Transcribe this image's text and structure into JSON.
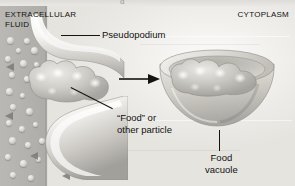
{
  "figure": {
    "top_crop_remnant": "d"
  },
  "regions": {
    "extracellular_fluid": {
      "line1": "Extracellular",
      "line2": "Fluid",
      "full": "EXTRACELLULAR FLUID"
    },
    "cytoplasm": {
      "label": "Cytoplasm"
    }
  },
  "labels": {
    "pseudopodium": "Pseudopodium",
    "food_particle_line1": "“Food” or",
    "food_particle_line2": "other particle",
    "food_vacuole_line1": "Food",
    "food_vacuole_line2": "vacuole"
  },
  "structures": {
    "pseudopod_upper": "pseudopod-upper-arm",
    "pseudopod_lower": "pseudopod-lower-arm",
    "food_particle": "food-particle-cluster",
    "food_vacuole": "food-vacuole-bowl",
    "engulfment_arrow": "engulfment-arrow"
  },
  "colors": {
    "extracellular_fluid": "#b3b2ae",
    "cytoplasm": "#eeedea",
    "membrane_light": "#f7f6f4",
    "membrane_shadow": "#a9a7a1",
    "particle": "#c9c7c1",
    "vacuole_rim": "#bdbbb5",
    "label_text": "#14130f",
    "arrow": "#15140f"
  }
}
